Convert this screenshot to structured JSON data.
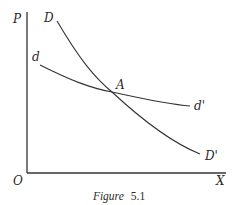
{
  "figure": {
    "caption_italic": "Figure",
    "caption_number": "5.1",
    "axes": {
      "y_label": "P",
      "x_label": "X",
      "origin_label": "O"
    },
    "curves": [
      {
        "name": "D",
        "start_label": "D",
        "end_label": "D'",
        "description": "steeper demand curve"
      },
      {
        "name": "d",
        "start_label": "d",
        "end_label": "d'",
        "description": "flatter demand curve"
      }
    ],
    "intersection_label": "A"
  }
}
